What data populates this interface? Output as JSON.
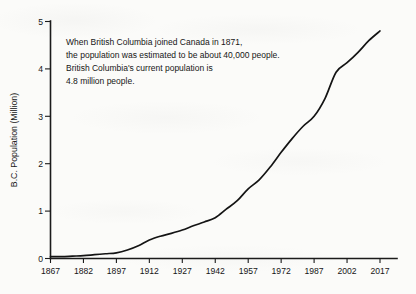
{
  "chart_data": {
    "type": "line",
    "title": "",
    "xlabel": "",
    "ylabel": "B.C. Population (Million)",
    "xlim": [
      1867,
      2017
    ],
    "ylim": [
      0,
      5
    ],
    "grid": false,
    "legend": false,
    "x_ticks": [
      "1867",
      "1882",
      "1897",
      "1912",
      "1927",
      "1942",
      "1957",
      "1972",
      "1987",
      "2002",
      "2017"
    ],
    "y_ticks": [
      "0",
      "1",
      "2",
      "3",
      "4",
      "5"
    ],
    "annotations": [
      "When British Columbia joined Canada in 1871,",
      "the population was estimated to be about 40,000 people.",
      "British Columbia's current population is",
      "4.8 million people."
    ],
    "series": [
      {
        "name": "B.C. Population",
        "x": [
          1867,
          1872,
          1877,
          1882,
          1887,
          1892,
          1897,
          1902,
          1907,
          1912,
          1917,
          1922,
          1927,
          1932,
          1937,
          1942,
          1947,
          1952,
          1957,
          1962,
          1967,
          1972,
          1977,
          1982,
          1987,
          1992,
          1997,
          2002,
          2007,
          2012,
          2017
        ],
        "values": [
          0.04,
          0.04,
          0.05,
          0.06,
          0.08,
          0.1,
          0.12,
          0.18,
          0.27,
          0.39,
          0.47,
          0.53,
          0.6,
          0.69,
          0.77,
          0.86,
          1.04,
          1.22,
          1.47,
          1.66,
          1.93,
          2.24,
          2.53,
          2.79,
          3.0,
          3.38,
          3.93,
          4.13,
          4.35,
          4.6,
          4.8
        ]
      }
    ]
  },
  "axes": {
    "y_title": "B.C. Population (Million)"
  }
}
